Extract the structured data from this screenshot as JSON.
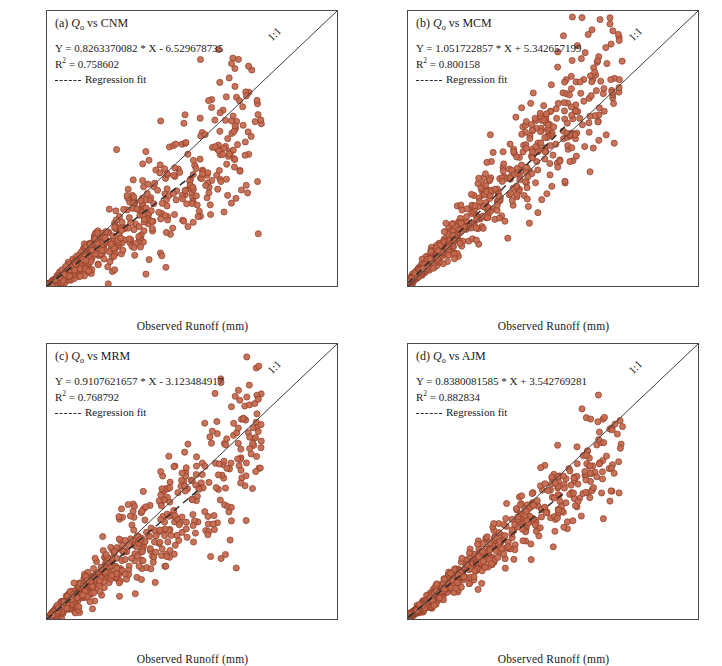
{
  "figure": {
    "axis": {
      "xlabel": "Observed Runoff (mm)",
      "ylabel": "Estimated Runoff (mm)",
      "xlim": [
        0,
        500
      ],
      "ylim": [
        0,
        500
      ],
      "xticks": [
        0,
        50,
        100,
        150,
        200,
        250,
        300,
        350,
        400,
        450,
        500
      ],
      "yticks": [
        0,
        50,
        100,
        150,
        200,
        250,
        300,
        350,
        400,
        450,
        500
      ],
      "grid": false
    },
    "legend": {
      "regression_label": "Regression fit",
      "one_to_one_label": "1:1"
    },
    "marker": {
      "fill": "#c4694f",
      "edge": "#8e3a24",
      "radius": 3.1
    },
    "line_colors": {
      "one_to_one": "#3c3c3c",
      "regression": "#2b2b2b"
    }
  },
  "chart_data": [
    {
      "type": "scatter",
      "panel": "a",
      "title_prefix": "(a)",
      "title_var": "Q",
      "title_sub": "o",
      "title_rest": "vs CNM",
      "title_full": "(a) Qo vs CNM",
      "equation": "Y = 0.8263370082 * X - 6.529678735",
      "r2_label": "R",
      "r2_exp": "2",
      "r2_value": "= 0.758602",
      "r2_full": "R2 = 0.758602",
      "slope": 0.8263370082,
      "intercept": -6.529678735,
      "r2": 0.758602,
      "xlabel": "Observed Runoff (mm)",
      "ylabel": "Estimated Runoff (mm)",
      "xlim": [
        0,
        500
      ],
      "ylim": [
        0,
        500
      ],
      "n_points": 760,
      "x_max_data": 370,
      "scatter_sigma": 0.34,
      "fit_x_end": 260,
      "seed": 11,
      "outliers": [
        [
          296,
          430
        ],
        [
          330,
          412
        ],
        [
          352,
          272
        ],
        [
          318,
          300
        ],
        [
          236,
          296
        ],
        [
          196,
          300
        ],
        [
          222,
          258
        ],
        [
          165,
          222
        ],
        [
          268,
          204
        ],
        [
          300,
          190
        ],
        [
          218,
          168
        ],
        [
          250,
          150
        ],
        [
          282,
          130
        ],
        [
          196,
          122
        ],
        [
          243,
          108
        ],
        [
          150,
          70
        ],
        [
          176,
          48
        ],
        [
          205,
          34
        ],
        [
          120,
          248
        ],
        [
          140,
          176
        ]
      ]
    },
    {
      "type": "scatter",
      "panel": "b",
      "title_prefix": "(b)",
      "title_var": "Q",
      "title_sub": "o",
      "title_rest": "vs MCM",
      "title_full": "(b) Qo vs MCM",
      "equation": "Y = 1.051722857 * X + 5.342657199",
      "r2_label": "R",
      "r2_exp": "2",
      "r2_value": "= 0.800158",
      "r2_full": "R2 = 0.800158",
      "slope": 1.051722857,
      "intercept": 5.342657199,
      "r2": 0.800158,
      "xlabel": "Observed Runoff (mm)",
      "ylabel": "Estimated Runoff (mm)",
      "xlim": [
        0,
        500
      ],
      "ylim": [
        0,
        500
      ],
      "n_points": 760,
      "x_max_data": 370,
      "scatter_sigma": 0.3,
      "fit_x_end": 272,
      "seed": 23,
      "outliers": [
        [
          300,
          488
        ],
        [
          268,
          455
        ],
        [
          292,
          437
        ],
        [
          258,
          398
        ],
        [
          216,
          351
        ],
        [
          196,
          324
        ],
        [
          186,
          307
        ],
        [
          204,
          299
        ],
        [
          228,
          314
        ],
        [
          330,
          324
        ],
        [
          142,
          275
        ],
        [
          176,
          258
        ],
        [
          210,
          268
        ],
        [
          236,
          270
        ],
        [
          164,
          244
        ],
        [
          122,
          196
        ],
        [
          150,
          176
        ],
        [
          188,
          166
        ],
        [
          250,
          238
        ],
        [
          352,
          352
        ]
      ]
    },
    {
      "type": "scatter",
      "panel": "c",
      "title_prefix": "(c)",
      "title_var": "Q",
      "title_sub": "o",
      "title_rest": "vs MRM",
      "title_full": "(c) Qo vs MRM",
      "equation": "Y = 0.9107621657 * X - 3.123484917",
      "r2_label": "R",
      "r2_exp": "2",
      "r2_value": "= 0.768792",
      "r2_full": "R2 = 0.768792",
      "slope": 0.9107621657,
      "intercept": -3.123484917,
      "r2": 0.768792,
      "xlabel": "Observed Runoff (mm)",
      "ylabel": "Estimated Runoff (mm)",
      "xlim": [
        0,
        500
      ],
      "ylim": [
        0,
        500
      ],
      "n_points": 800,
      "x_max_data": 370,
      "scatter_sigma": 0.33,
      "fit_x_end": 262,
      "seed": 37,
      "outliers": [
        [
          300,
          430
        ],
        [
          330,
          416
        ],
        [
          318,
          386
        ],
        [
          272,
          356
        ],
        [
          352,
          300
        ],
        [
          243,
          318
        ],
        [
          210,
          296
        ],
        [
          196,
          268
        ],
        [
          232,
          252
        ],
        [
          262,
          236
        ],
        [
          166,
          232
        ],
        [
          140,
          208
        ],
        [
          288,
          188
        ],
        [
          252,
          170
        ],
        [
          214,
          152
        ],
        [
          178,
          128
        ],
        [
          300,
          110
        ],
        [
          205,
          96
        ],
        [
          124,
          186
        ],
        [
          96,
          150
        ]
      ]
    },
    {
      "type": "scatter",
      "panel": "d",
      "title_prefix": "(d)",
      "title_var": "Q",
      "title_sub": "o",
      "title_rest": "vs AJM",
      "title_full": "(d) Qo vs AJM",
      "equation": "Y = 0.8380081585 * X + 3.542769281",
      "r2_label": "R",
      "r2_exp": "2",
      "r2_value": "= 0.882834",
      "r2_full": "R2 = 0.882834",
      "slope": 0.8380081585,
      "intercept": 3.542769281,
      "r2": 0.882834,
      "xlabel": "Observed Runoff (mm)",
      "ylabel": "Estimated Runoff (mm)",
      "xlim": [
        0,
        500
      ],
      "ylim": [
        0,
        500
      ],
      "n_points": 800,
      "x_max_data": 370,
      "scatter_sigma": 0.22,
      "fit_x_end": 268,
      "seed": 53,
      "outliers": [
        [
          300,
          382
        ],
        [
          352,
          344
        ],
        [
          330,
          340
        ],
        [
          258,
          316
        ],
        [
          196,
          224
        ],
        [
          214,
          228
        ],
        [
          236,
          246
        ],
        [
          248,
          258
        ],
        [
          268,
          260
        ],
        [
          330,
          282
        ],
        [
          170,
          210
        ],
        [
          150,
          148
        ],
        [
          120,
          136
        ],
        [
          286,
          256
        ],
        [
          228,
          166
        ],
        [
          184,
          172
        ],
        [
          106,
          120
        ],
        [
          92,
          58
        ],
        [
          262,
          214
        ],
        [
          204,
          196
        ]
      ]
    }
  ]
}
